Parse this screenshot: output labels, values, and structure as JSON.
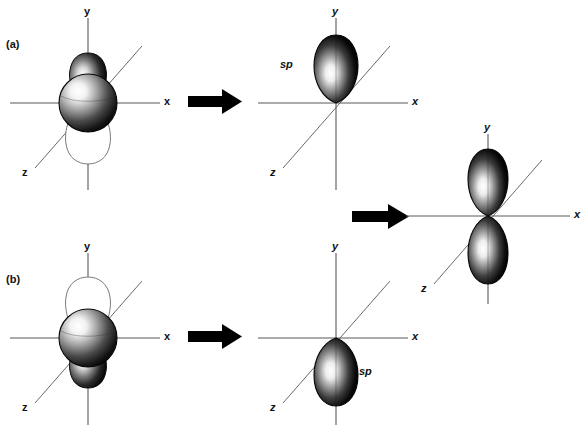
{
  "figure": {
    "faint_header": "",
    "panels": [
      {
        "id": "a",
        "letter": "(a)",
        "stage": "reactant",
        "axes": {
          "x": "x",
          "y": "y",
          "z": "z"
        },
        "orbitals": [
          {
            "kind": "s-orbital-sphere",
            "shading": "filled"
          },
          {
            "kind": "p-orbital-lobe-up",
            "shading": "filled"
          },
          {
            "kind": "p-orbital-lobe-down",
            "shading": "outline"
          }
        ]
      },
      {
        "id": "a-product",
        "letter": "",
        "stage": "product",
        "axes": {
          "x": "x",
          "y": "y",
          "z": "z"
        },
        "orbital_label": "sp",
        "orbitals": [
          {
            "kind": "sp-hybrid-lobe-up",
            "shading": "filled"
          }
        ]
      },
      {
        "id": "b",
        "letter": "(b)",
        "stage": "reactant",
        "axes": {
          "x": "x",
          "y": "y",
          "z": "z"
        },
        "orbitals": [
          {
            "kind": "s-orbital-sphere",
            "shading": "filled"
          },
          {
            "kind": "p-orbital-lobe-up",
            "shading": "outline"
          },
          {
            "kind": "p-orbital-lobe-down",
            "shading": "filled"
          }
        ]
      },
      {
        "id": "b-product",
        "letter": "",
        "stage": "product",
        "axes": {
          "x": "x",
          "y": "y",
          "z": "z"
        },
        "orbital_label": "sp",
        "orbitals": [
          {
            "kind": "sp-hybrid-lobe-down",
            "shading": "filled"
          }
        ]
      },
      {
        "id": "combined",
        "letter": "",
        "stage": "result",
        "axes": {
          "x": "x",
          "y": "y",
          "z": "z"
        },
        "orbitals": [
          {
            "kind": "sp-hybrid-lobe-up",
            "shading": "filled"
          },
          {
            "kind": "sp-hybrid-lobe-down",
            "shading": "filled"
          }
        ]
      }
    ],
    "arrows": [
      {
        "id": "arrow-a",
        "direction": "right"
      },
      {
        "id": "arrow-b",
        "direction": "right"
      },
      {
        "id": "arrow-combine",
        "direction": "right"
      }
    ],
    "colors": {
      "axis": "#595959",
      "lobe_dark": "#0a0a0a",
      "lobe_light": "#ffffff",
      "outline": "#6b6b6b",
      "arrow": "#000000",
      "text": "#111111",
      "background": "#ffffff"
    }
  }
}
